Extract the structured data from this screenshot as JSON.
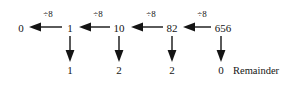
{
  "diagram": {
    "operator_label": "÷8",
    "remainder_label": "Remainder",
    "quotient_chain": [
      {
        "value": "0"
      },
      {
        "value": "1"
      },
      {
        "value": "10"
      },
      {
        "value": "82"
      },
      {
        "value": "656"
      }
    ],
    "steps": [
      {
        "operator": "÷8",
        "quotient": "0",
        "remainder": "1"
      },
      {
        "operator": "÷8",
        "quotient": "1",
        "remainder": "2"
      },
      {
        "operator": "÷8",
        "quotient": "10",
        "remainder": "2"
      },
      {
        "operator": "÷8",
        "quotient": "82",
        "remainder": "0"
      }
    ],
    "remainders": [
      {
        "value": "1"
      },
      {
        "value": "2"
      },
      {
        "value": "2"
      },
      {
        "value": "0"
      }
    ],
    "colors": {
      "background": "#ffffff",
      "ink": "#141414"
    }
  }
}
